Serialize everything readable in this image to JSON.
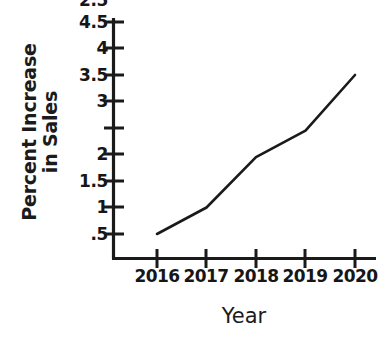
{
  "chart_data": {
    "type": "line",
    "title": "",
    "xlabel": "Year",
    "ylabel_line1": "Percent Increase",
    "ylabel_line2": "in Sales",
    "ylabel": "Percent Increase in Sales",
    "categories": [
      "2016",
      "2017",
      "2018",
      "2019",
      "2020"
    ],
    "x": [
      2016,
      2017,
      2018,
      2019,
      2020
    ],
    "values": [
      0.5,
      1,
      1.95,
      2.45,
      3.5
    ],
    "series": [
      {
        "name": "Percent Increase in Sales",
        "values": [
          0.5,
          1,
          1.95,
          2.45,
          3.5
        ]
      }
    ],
    "ylim": [
      0,
      4.75
    ],
    "xlim": [
      2015.8,
      2020.3
    ],
    "ytick_values": [
      4.5,
      4,
      3.5,
      3,
      2.5,
      2,
      1.5,
      1,
      0.5
    ],
    "ytick_labels": [
      "4.5",
      "4",
      "3.5",
      "3",
      "2.5",
      "2",
      "1.5",
      "1",
      ".5"
    ],
    "xtick_labels": [
      "2016",
      "2017",
      "2018",
      "2019",
      "2020"
    ],
    "grid": false,
    "legend": false,
    "legend_position": "none",
    "markers": false,
    "line_color": "#1a1a1a",
    "axis_color": "#1a1a1a",
    "background_color": "#ffffff",
    "text_color": "#161616",
    "annotations": []
  }
}
